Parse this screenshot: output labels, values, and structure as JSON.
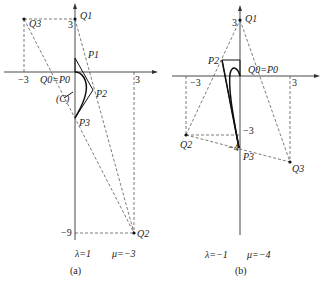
{
  "panels": [
    {
      "id": "a",
      "caption": "(a)",
      "params": {
        "lambda_label": "λ=1",
        "mu_label": "μ=−3"
      },
      "axis_ticks": {
        "x_neg": "−3",
        "x_pos": "3",
        "y_pos": "3",
        "y_neg": "−9"
      },
      "points": {
        "Q0P0": "Q0=P0",
        "Q1": "Q1",
        "Q2": "Q2",
        "Q3": "Q3",
        "P1": "P1",
        "P2": "P2",
        "P3": "P3",
        "C": "(C)"
      }
    },
    {
      "id": "b",
      "caption": "(b)",
      "params": {
        "lambda_label": "λ=−1",
        "mu_label": "μ=−4"
      },
      "axis_ticks": {
        "x_neg": "−3",
        "x_pos": "3",
        "y_pos": "3",
        "y_neg3": "−3",
        "y_neg4": "−4"
      },
      "points": {
        "Q0P0": "Q0=P0",
        "Q1": "Q1",
        "Q2": "Q2",
        "Q3": "Q3",
        "P2": "P2",
        "P3": "P3"
      }
    }
  ]
}
